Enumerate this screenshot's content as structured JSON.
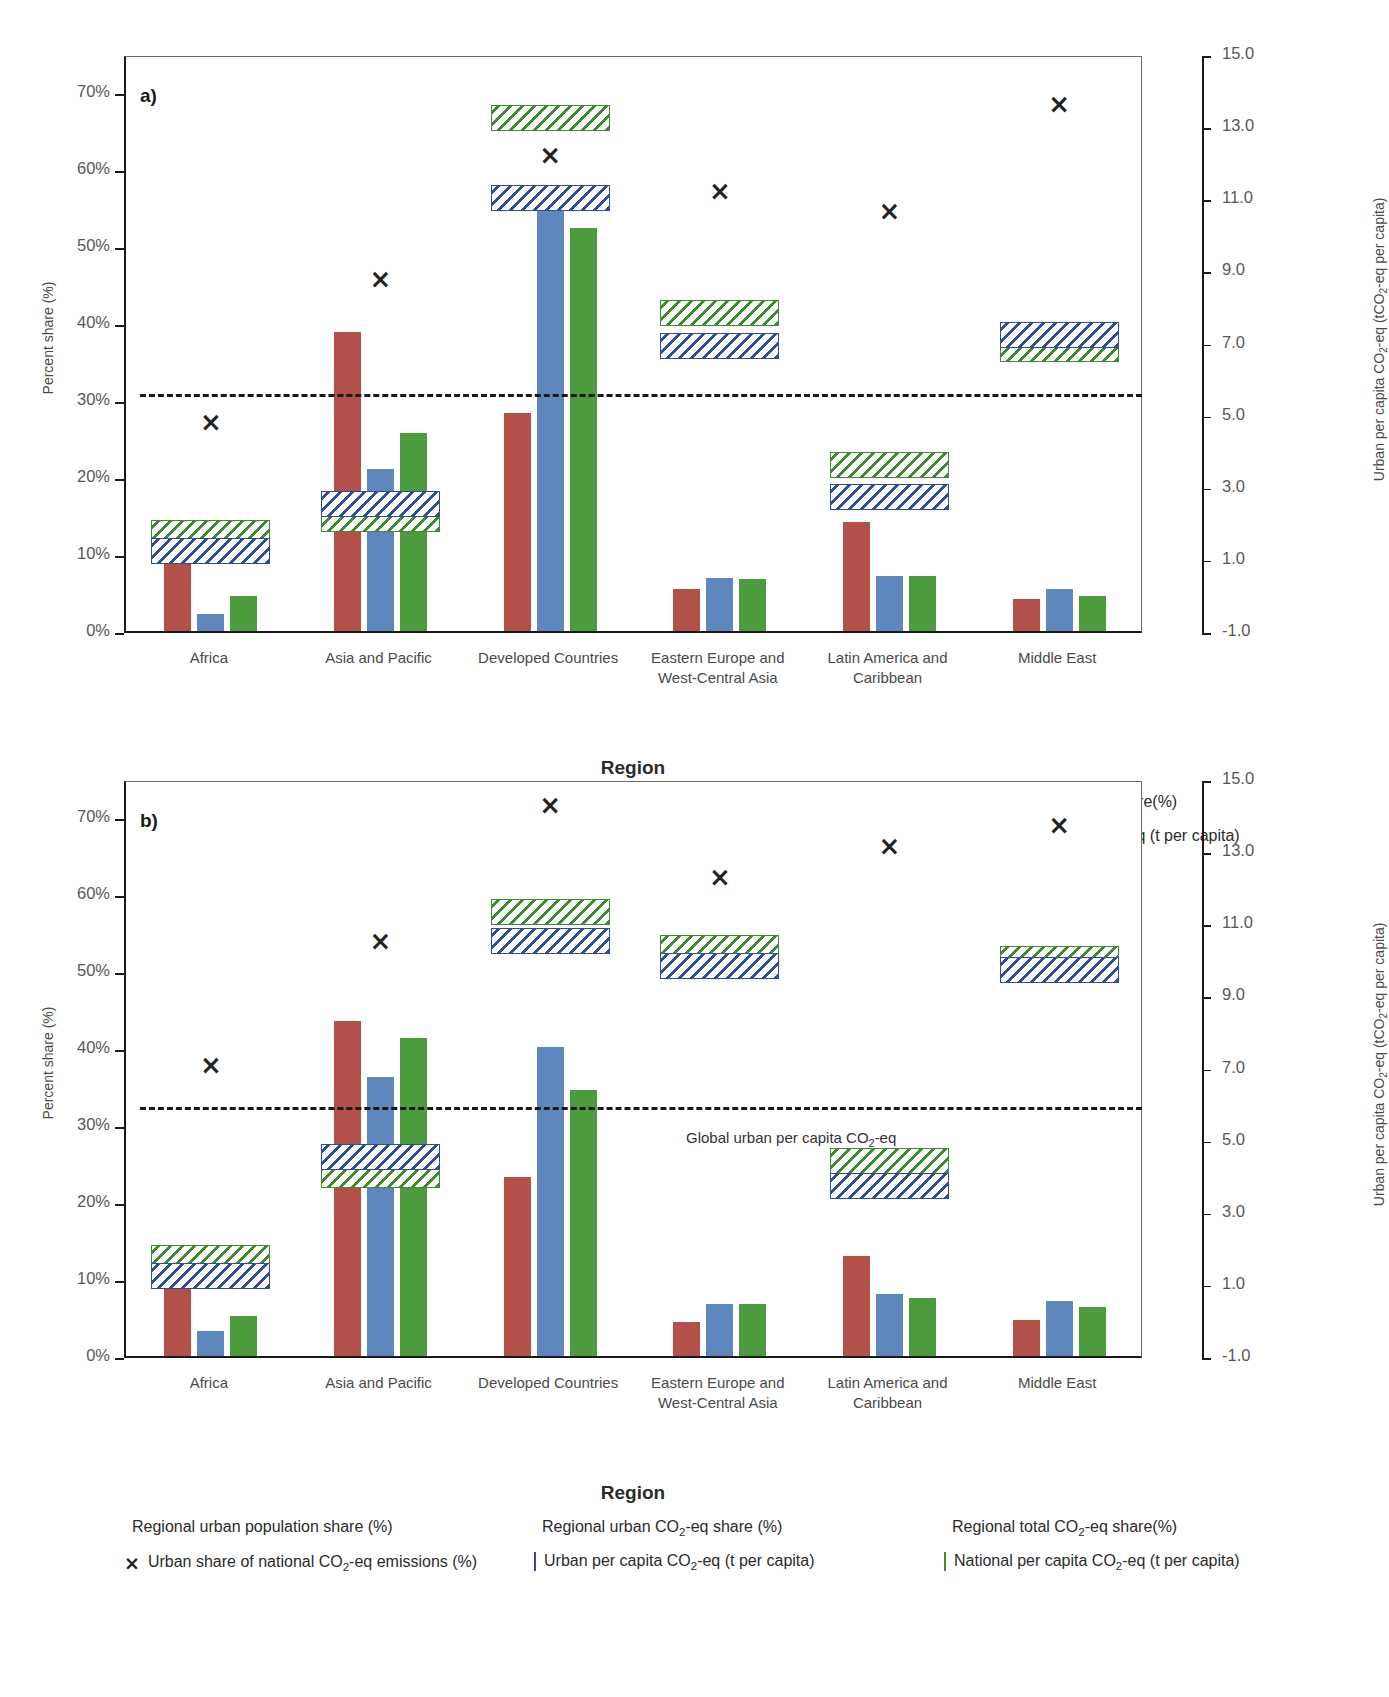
{
  "figure": {
    "panels": [
      {
        "tag": "a)",
        "id": "a"
      },
      {
        "tag": "b)",
        "id": "b"
      }
    ],
    "axis": {
      "left_title": "Percent share (%)",
      "right_title_pre": "Urban per capita CO",
      "right_title_post": "-eq (tCO",
      "right_title_end": "-eq per capita)",
      "right_title_full": "Urban per capita CO2-eq (tCO2-eq per capita)",
      "xlabel": "Region",
      "left_ticks": [
        "0%",
        "10%",
        "20%",
        "30%",
        "40%",
        "50%",
        "60%",
        "70%"
      ],
      "right_ticks": [
        "-1.0",
        "1.0",
        "3.0",
        "5.0",
        "7.0",
        "9.0",
        "11.0",
        "13.0",
        "15.0"
      ],
      "left_range": [
        0,
        75
      ],
      "right_range": [
        -1.0,
        15.0
      ]
    },
    "categories": [
      "Africa",
      "Asia and Pacific",
      "Developed Countries",
      "Eastern Europe and\nWest-Central Asia",
      "Latin America and\nCaribbean",
      "Middle East"
    ],
    "category_lines": [
      [
        "Africa"
      ],
      [
        "Asia and Pacific"
      ],
      [
        "Developed Countries"
      ],
      [
        "Eastern Europe and",
        "West-Central Asia"
      ],
      [
        "Latin America and",
        "Caribbean"
      ],
      [
        "Middle East"
      ]
    ],
    "legend": {
      "row1": [
        {
          "name": "regional-urban-population-share",
          "type": "bar",
          "color_key": "red",
          "label": "Regional urban population share (%)"
        },
        {
          "name": "regional-urban-co2eq-share",
          "type": "bar",
          "color_key": "blue",
          "label": "Regional urban CO2-eq share (%)"
        },
        {
          "name": "regional-total-co2eq-share",
          "type": "bar",
          "color_key": "green",
          "label": "Regional total CO2-eq share(%)"
        }
      ],
      "row2": [
        {
          "name": "urban-share-of-national-co2eq",
          "type": "x",
          "color_key": "black",
          "label": "Urban share of national CO2-eq emissions (%)"
        },
        {
          "name": "urban-per-capita-co2eq",
          "type": "hatch",
          "color_key": "blue",
          "label": "Urban per capita CO2-eq (t per capita)"
        },
        {
          "name": "national-per-capita-co2eq",
          "type": "hatch",
          "color_key": "green",
          "label": "National per capita CO2-eq (t per capita)"
        }
      ]
    },
    "annotation_b": "Global urban per capita CO2-eq",
    "colors": {
      "red": "#b2514a",
      "blue": "#5e87be",
      "green": "#4c9c3f",
      "hatch_blue": "#2e4d9b",
      "hatch_green": "#3d8a2f",
      "axis": "#1a1a1a",
      "text": "#4a4a4a"
    }
  },
  "chart_data": [
    {
      "type": "bar",
      "panel": "a",
      "title": "a)",
      "xlabel": "Region",
      "ylabel": "Percent share (%)",
      "y2label": "Urban per capita CO2-eq (tCO2-eq per capita)",
      "ylim": [
        0,
        75
      ],
      "y2lim": [
        -1.0,
        15.0
      ],
      "grid": false,
      "legend_position": "below",
      "categories": [
        "Africa",
        "Asia and Pacific",
        "Developed Countries",
        "Eastern Europe and West-Central Asia",
        "Latin America and Caribbean",
        "Middle East"
      ],
      "series": [
        {
          "name": "Regional urban population share (%)",
          "unit": "%",
          "axis": "left",
          "values": [
            9.6,
            38.9,
            28.3,
            5.5,
            14.2,
            4.2
          ]
        },
        {
          "name": "Regional urban CO2-eq share (%)",
          "unit": "%",
          "axis": "left",
          "values": [
            2.2,
            21.1,
            57.6,
            6.9,
            7.1,
            5.5
          ]
        },
        {
          "name": "Regional total CO2-eq share(%)",
          "unit": "%",
          "axis": "left",
          "values": [
            4.6,
            25.7,
            52.4,
            6.7,
            7.2,
            4.5
          ]
        },
        {
          "name": "Urban share of national CO2-eq emissions (%)",
          "unit": "%",
          "axis": "left",
          "marker": "x",
          "values": [
            27.5,
            46.2,
            62.3,
            57.6,
            55.0,
            68.9
          ]
        },
        {
          "name": "Urban per capita CO2-eq (t per capita)",
          "unit": "tCO2-eq per capita",
          "axis": "right",
          "render": "range-band",
          "values": [
            1.3,
            2.6,
            11.1,
            7.0,
            2.8,
            7.3
          ],
          "band_halfwidth_pct": 0.55
        },
        {
          "name": "National per capita CO2-eq (t per capita)",
          "unit": "tCO2-eq per capita",
          "axis": "right",
          "render": "range-band",
          "values": [
            1.8,
            2.2,
            13.3,
            7.9,
            3.7,
            6.9
          ],
          "band_halfwidth_pct": 0.55
        }
      ],
      "reference_line": {
        "label": "",
        "axis": "right",
        "value": 5.65,
        "style": "dashed"
      }
    },
    {
      "type": "bar",
      "panel": "b",
      "title": "b)",
      "xlabel": "Region",
      "ylabel": "Percent share (%)",
      "y2label": "Urban per capita CO2-eq (tCO2-eq per capita)",
      "ylim": [
        0,
        75
      ],
      "y2lim": [
        -1.0,
        15.0
      ],
      "grid": false,
      "legend_position": "below",
      "categories": [
        "Africa",
        "Asia and Pacific",
        "Developed Countries",
        "Eastern Europe and West-Central Asia",
        "Latin America and Caribbean",
        "Middle East"
      ],
      "series": [
        {
          "name": "Regional urban population share (%)",
          "unit": "%",
          "axis": "left",
          "values": [
            11.9,
            43.5,
            23.3,
            4.4,
            13.0,
            4.7
          ]
        },
        {
          "name": "Regional urban CO2-eq share (%)",
          "unit": "%",
          "axis": "left",
          "values": [
            3.3,
            36.3,
            40.2,
            6.7,
            8.1,
            7.1
          ]
        },
        {
          "name": "Regional total CO2-eq share(%)",
          "unit": "%",
          "axis": "left",
          "values": [
            5.2,
            41.3,
            34.6,
            6.7,
            7.6,
            6.4
          ]
        },
        {
          "name": "Urban share of national CO2-eq emissions (%)",
          "unit": "%",
          "axis": "left",
          "marker": "x",
          "values": [
            38.2,
            54.3,
            72.0,
            62.7,
            66.7,
            69.4
          ]
        },
        {
          "name": "Urban per capita CO2-eq (t per capita)",
          "unit": "tCO2-eq per capita",
          "axis": "right",
          "render": "range-band",
          "values": [
            1.3,
            4.6,
            10.6,
            9.9,
            3.8,
            9.8
          ],
          "band_halfwidth_pct": 0.55
        },
        {
          "name": "National per capita CO2-eq (t per capita)",
          "unit": "tCO2-eq per capita",
          "axis": "right",
          "render": "range-band",
          "values": [
            1.8,
            4.1,
            11.4,
            10.4,
            4.5,
            10.1
          ],
          "band_halfwidth_pct": 0.55
        }
      ],
      "reference_line": {
        "label": "Global urban per capita CO2-eq",
        "axis": "right",
        "value": 6.0,
        "style": "dashed"
      }
    }
  ]
}
